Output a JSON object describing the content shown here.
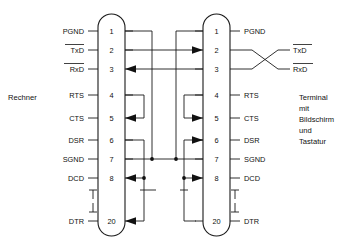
{
  "diagram": {
    "title_left": "Rechner",
    "title_right_lines": [
      "Terminal",
      "mit",
      "Bildschirm",
      "und",
      "Tastatur"
    ],
    "colors": {
      "ink": "#1a1a1a",
      "background": "#ffffff"
    },
    "left_connector": {
      "name": "Rechner-Stecker",
      "pins": [
        {
          "num": "1",
          "label": "PGND",
          "overline": false
        },
        {
          "num": "2",
          "label": "TxD",
          "overline": true
        },
        {
          "num": "3",
          "label": "RxD",
          "overline": true
        },
        {
          "num": "4",
          "label": "RTS",
          "overline": false
        },
        {
          "num": "5",
          "label": "CTS",
          "overline": false
        },
        {
          "num": "6",
          "label": "DSR",
          "overline": false
        },
        {
          "num": "7",
          "label": "SGND",
          "overline": false
        },
        {
          "num": "8",
          "label": "DCD",
          "overline": false
        },
        {
          "num": "20",
          "label": "DTR",
          "overline": false
        }
      ]
    },
    "right_connector": {
      "name": "Terminal-Stecker",
      "pins": [
        {
          "num": "1",
          "label": "PGND",
          "overline": false
        },
        {
          "num": "2",
          "label": "TxD",
          "overline": true
        },
        {
          "num": "3",
          "label": "RxD",
          "overline": true
        },
        {
          "num": "4",
          "label": "RTS",
          "overline": false
        },
        {
          "num": "5",
          "label": "CTS",
          "overline": false
        },
        {
          "num": "6",
          "label": "DSR",
          "overline": false
        },
        {
          "num": "7",
          "label": "SGND",
          "overline": false
        },
        {
          "num": "8",
          "label": "DCD",
          "overline": false
        },
        {
          "num": "20",
          "label": "DTR",
          "overline": false
        }
      ]
    },
    "connections": [
      {
        "name": "pgnd-to-sgnd-left",
        "from": "left pin 1",
        "to": "SGND bus"
      },
      {
        "name": "pgnd-to-sgnd-right",
        "from": "right pin 1",
        "to": "SGND bus"
      },
      {
        "name": "txd-left-to-rxd-right",
        "from": "left pin 2",
        "to": "right pin 2",
        "arrow": "right"
      },
      {
        "name": "rxd-left-from-right",
        "from": "right pin 3",
        "to": "left pin 3",
        "arrow": "left"
      },
      {
        "name": "rts-cts-loop-left",
        "from": "left pin 4",
        "to": "left pin 5",
        "arrow": "left"
      },
      {
        "name": "rts-cts-loop-right",
        "from": "right pin 4",
        "to": "right pin 5",
        "arrow": "right"
      },
      {
        "name": "dsr-dcd-dtr-left",
        "from": "left pin 6",
        "to": "left pin 8 and left pin 20",
        "arrow": "left"
      },
      {
        "name": "dsr-dcd-dtr-right",
        "from": "right pin 6",
        "to": "right pin 8 and right pin 20",
        "arrow": "right"
      },
      {
        "name": "sgnd-bus",
        "from": "left pin 7",
        "to": "right pin 7"
      }
    ],
    "right_crossover": {
      "name": "txd-rxd-crossover",
      "labels": [
        {
          "label": "TxD",
          "overline": true,
          "from_pin": "3"
        },
        {
          "label": "RxD",
          "overline": true,
          "from_pin": "2"
        }
      ]
    }
  }
}
